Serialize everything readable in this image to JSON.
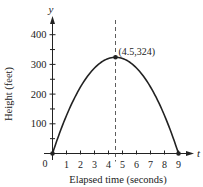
{
  "chart_data": {
    "type": "line",
    "title": "",
    "xlabel": "Elapsed time (seconds)",
    "ylabel": "Height (feet)",
    "x_axis_var": "t",
    "y_axis_var": "y",
    "origin_label": "0",
    "xlim": [
      0,
      9.5
    ],
    "ylim": [
      0,
      450
    ],
    "x_ticks": [
      1,
      2,
      3,
      4,
      5,
      6,
      7,
      8,
      9
    ],
    "x_tick_labels": [
      "1",
      "2",
      "3",
      "4",
      "5",
      "6",
      "7",
      "8",
      "9"
    ],
    "y_ticks": [
      100,
      200,
      300,
      400
    ],
    "y_tick_labels": [
      "100",
      "200",
      "300",
      "400"
    ],
    "y_minor_ticks": [
      50,
      150,
      250,
      350
    ],
    "grid": false,
    "series": [
      {
        "name": "height",
        "equation": "y = -16t^2 + 144t",
        "x": [
          0,
          0.5,
          1,
          1.5,
          2,
          2.5,
          3,
          3.5,
          4,
          4.5,
          5,
          5.5,
          6,
          6.5,
          7,
          7.5,
          8,
          8.5,
          9
        ],
        "values": [
          0,
          68,
          128,
          180,
          224,
          260,
          288,
          308,
          320,
          324,
          320,
          308,
          288,
          260,
          224,
          180,
          128,
          68,
          0
        ]
      }
    ],
    "annotations": [
      {
        "type": "point",
        "x": 4.5,
        "y": 324,
        "label": "(4.5,324)"
      },
      {
        "type": "vline",
        "x": 4.5,
        "style": "dashed"
      },
      {
        "type": "point",
        "x": 0,
        "y": 0
      },
      {
        "type": "point",
        "x": 9,
        "y": 0
      }
    ]
  }
}
